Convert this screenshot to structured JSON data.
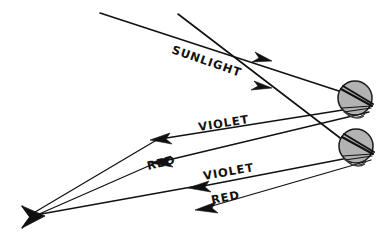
{
  "diagram": {
    "background_color": "#ffffff",
    "ink_color": "#111111",
    "droplet_fill_color": "#b2b2b2",
    "labels": {
      "sunlight": "SUNLIGHT",
      "violet_upper": "VIOLET",
      "red_upper": "RED",
      "violet_lower": "VIOLET",
      "red_lower": "RED"
    },
    "rays": [
      {
        "name": "sunlight-ray-upper",
        "label": "SUNLIGHT",
        "from": [
          100,
          13
        ],
        "to": [
          340,
          92
        ],
        "arrow_at": [
          266,
          58
        ],
        "direction": "down-right"
      },
      {
        "name": "sunlight-ray-lower",
        "label": "SUNLIGHT",
        "from": [
          178,
          14
        ],
        "to": [
          340,
          139
        ],
        "arrow_at": [
          266,
          85
        ],
        "direction": "down-right"
      },
      {
        "name": "violet-ray-upper",
        "label": "VIOLET",
        "from": [
          366,
          108
        ],
        "to": [
          152,
          140
        ],
        "arrow_at": [
          158,
          139
        ],
        "direction": "left"
      },
      {
        "name": "red-ray-upper",
        "label": "RED",
        "from": [
          368,
          112
        ],
        "to": [
          152,
          163
        ],
        "arrow_at": [
          158,
          162
        ],
        "direction": "left"
      },
      {
        "name": "violet-ray-lower",
        "label": "VIOLET",
        "from": [
          368,
          156
        ],
        "to": [
          190,
          188
        ],
        "arrow_at": [
          196,
          187
        ],
        "direction": "left"
      },
      {
        "name": "red-ray-lower",
        "label": "RED",
        "from": [
          370,
          160
        ],
        "to": [
          197,
          209
        ],
        "arrow_at": [
          203,
          208
        ],
        "direction": "left"
      },
      {
        "name": "violet-to-eye-ray",
        "from": [
          152,
          140
        ],
        "to": [
          27,
          216
        ],
        "direction": "down-left"
      },
      {
        "name": "red-to-eye-ray",
        "from": [
          152,
          163
        ],
        "to": [
          27,
          218
        ],
        "direction": "down-left"
      }
    ],
    "droplets": [
      {
        "name": "upper-raindrop",
        "center": [
          355,
          98
        ],
        "radius": 17
      },
      {
        "name": "lower-raindrop",
        "center": [
          356,
          146
        ],
        "radius": 17
      }
    ],
    "observer": {
      "name": "observer-eye",
      "position": [
        25,
        217
      ],
      "description": "eye of observer where rays converge"
    }
  }
}
